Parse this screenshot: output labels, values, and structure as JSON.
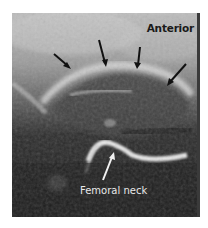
{
  "figure": {
    "type": "ultrasound-image",
    "labels": {
      "orientation": "Anterior",
      "structure": "Femoral neck"
    },
    "annotations": {
      "black_arrows_count": 4,
      "white_arrows_count": 1
    },
    "colors": {
      "background": "#ffffff",
      "orientation_text": "#1a1a1a",
      "structure_text": "#e8e8e8",
      "black_arrow": "#111111",
      "white_arrow": "#f2f2f2"
    }
  }
}
